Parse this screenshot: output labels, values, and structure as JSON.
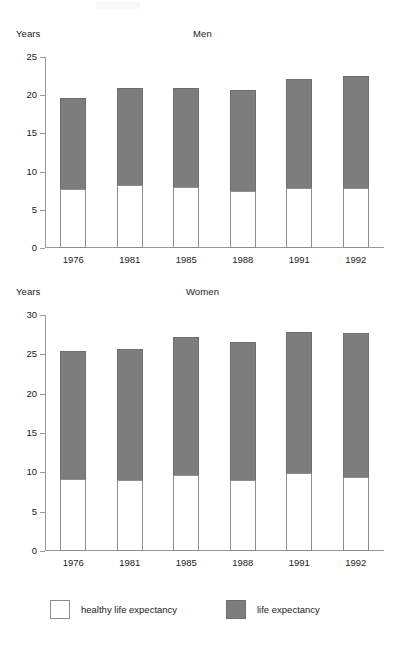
{
  "chart_data": {
    "type": "bar",
    "subtype": "stacked-bar",
    "panels": [
      {
        "title": "Men",
        "ylabel": "Years",
        "categories": [
          "1976",
          "1981",
          "1985",
          "1988",
          "1991",
          "1992"
        ],
        "ylim": [
          0,
          25
        ],
        "yticks": [
          0,
          5,
          10,
          15,
          20,
          25
        ],
        "ytick_labels": [
          "0",
          "5",
          "10",
          "15",
          "20",
          "25"
        ],
        "grid": false,
        "series": [
          {
            "name": "healthy life expectancy",
            "color": "#ffffff",
            "values": [
              7.7,
              8.3,
              8.0,
              7.5,
              7.9,
              7.8
            ]
          },
          {
            "name": "life expectancy",
            "color": "#7d7d7d",
            "values": [
              19.7,
              21.0,
              20.9,
              20.7,
              22.1,
              22.5
            ]
          }
        ]
      },
      {
        "title": "Women",
        "ylabel": "Years",
        "categories": [
          "1976",
          "1981",
          "1985",
          "1988",
          "1991",
          "1992"
        ],
        "ylim": [
          0,
          30
        ],
        "yticks": [
          0,
          5,
          10,
          15,
          20,
          25,
          30
        ],
        "ytick_labels": [
          "0",
          "5",
          "10",
          "15",
          "20",
          "25",
          "30"
        ],
        "grid": false,
        "series": [
          {
            "name": "healthy life expectancy",
            "color": "#ffffff",
            "values": [
              9.2,
              9.0,
              9.7,
              9.0,
              9.9,
              9.4
            ]
          },
          {
            "name": "life expectancy",
            "color": "#7d7d7d",
            "values": [
              25.4,
              25.7,
              27.2,
              26.6,
              27.8,
              27.7
            ]
          }
        ]
      }
    ],
    "legend": {
      "position": "bottom",
      "entries": [
        {
          "label": "healthy life expectancy",
          "color": "#ffffff"
        },
        {
          "label": "life expectancy",
          "color": "#7d7d7d"
        }
      ]
    }
  },
  "colors": {
    "life_expectancy": "#7d7d7d",
    "healthy_life_expectancy": "#ffffff",
    "axis": "#9a9a9a",
    "text": "#1a1a1a"
  }
}
